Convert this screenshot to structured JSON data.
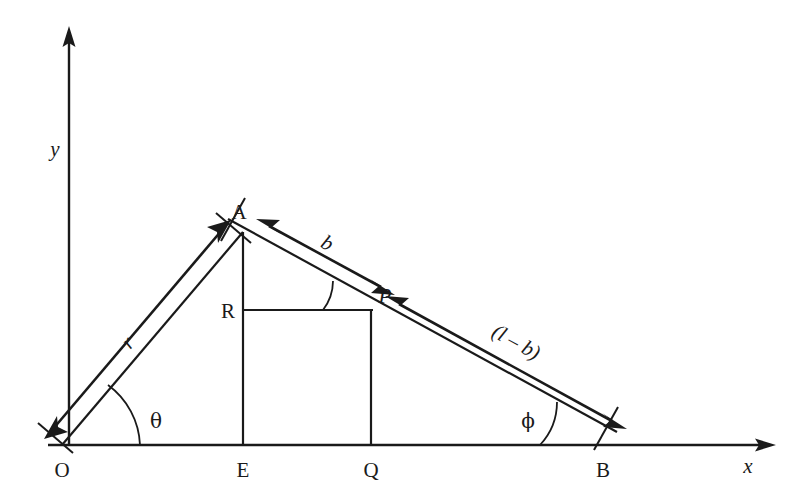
{
  "figure": {
    "background_color": "#ffffff",
    "line_color": "#1a1a1a"
  },
  "axes": {
    "x_label": "x",
    "y_label": "y",
    "origin_label": "O"
  },
  "points": [
    {
      "id": "O",
      "label": "O",
      "x": 62,
      "y": 445
    },
    {
      "id": "A",
      "label": "A",
      "x": 243,
      "y": 232
    },
    {
      "id": "E",
      "label": "E",
      "x": 243,
      "y": 445
    },
    {
      "id": "P",
      "label": "P",
      "x": 371,
      "y": 310
    },
    {
      "id": "Q",
      "label": "Q",
      "x": 371,
      "y": 445
    },
    {
      "id": "R",
      "label": "R",
      "x": 243,
      "y": 310
    },
    {
      "id": "B",
      "label": "B",
      "x": 603,
      "y": 445
    }
  ],
  "angles": [
    {
      "id": "theta",
      "label": "θ",
      "at": "O",
      "between": "x-axis and OA"
    },
    {
      "id": "phi",
      "label": "ϕ",
      "at": "B",
      "between": "x-axis and BA"
    },
    {
      "id": "at-P",
      "label": "",
      "at": "P",
      "between": "RP and PA"
    }
  ],
  "dimensions": [
    {
      "id": "r",
      "label": "r",
      "from": "O",
      "to": "A",
      "arrow": "double"
    },
    {
      "id": "b",
      "label": "b",
      "from": "A",
      "to": "P",
      "arrow": "double"
    },
    {
      "id": "l-minus-b",
      "label": "(l – b)",
      "from": "P",
      "to": "B",
      "arrow": "double"
    }
  ],
  "segments": [
    {
      "id": "OA",
      "from": "O",
      "to": "A"
    },
    {
      "id": "AB",
      "from": "A",
      "to": "B"
    },
    {
      "id": "AE",
      "from": "A",
      "to": "E"
    },
    {
      "id": "RP",
      "from": "R",
      "to": "P"
    },
    {
      "id": "PQ",
      "from": "P",
      "to": "Q"
    },
    {
      "id": "OB-baseline",
      "from": "O",
      "to": "B"
    }
  ]
}
